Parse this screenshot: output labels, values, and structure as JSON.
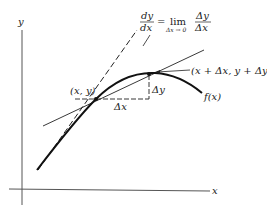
{
  "diagram": {
    "axes": {
      "x_label": "x",
      "y_label": "y"
    },
    "formula": {
      "lhs_num": "dy",
      "lhs_den": "dx",
      "equals": "=",
      "lim": "lim",
      "lim_sub": "Δx → 0",
      "rhs_num": "Δy",
      "rhs_den": "Δx"
    },
    "points": {
      "p1_label": "(x, y)",
      "p2_label": "(x + Δx, y + Δy)"
    },
    "increments": {
      "dx_label": "Δx",
      "dy_label": "Δy"
    },
    "curve_label": "f(x)",
    "colors": {
      "ink": "#222222",
      "axis": "#555555",
      "background": "#ffffff"
    }
  }
}
